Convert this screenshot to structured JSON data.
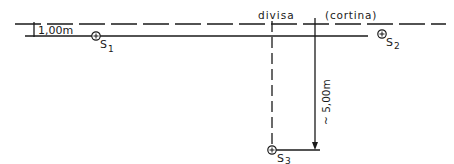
{
  "diagram": {
    "colors": {
      "ink": "#1a1a1a",
      "background": "#ffffff"
    },
    "labels": {
      "offset": "1,00m",
      "divisa": "divisa",
      "cortina": "(cortina)",
      "depth": "~ 5,00m"
    },
    "points": [
      {
        "id": "S1",
        "letter": "S",
        "index": "1"
      },
      {
        "id": "S2",
        "letter": "S",
        "index": "2"
      },
      {
        "id": "S3",
        "letter": "S",
        "index": "3"
      }
    ],
    "lines": {
      "cortina_line": "dashed",
      "survey_line": "solid",
      "divisa_line": "dashed",
      "depth_line": "solid"
    }
  }
}
